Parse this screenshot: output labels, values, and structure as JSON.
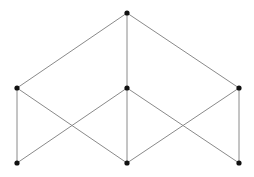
{
  "diagram": {
    "type": "hasse-diagram",
    "nodes": [
      {
        "id": "top",
        "x": 127,
        "y": 13
      },
      {
        "id": "mid-left",
        "x": 17,
        "y": 88
      },
      {
        "id": "mid-center",
        "x": 127,
        "y": 88
      },
      {
        "id": "mid-right",
        "x": 239,
        "y": 88
      },
      {
        "id": "bottom-left",
        "x": 17,
        "y": 163
      },
      {
        "id": "bottom-center",
        "x": 127,
        "y": 163
      },
      {
        "id": "bottom-right",
        "x": 239,
        "y": 163
      }
    ],
    "edges": [
      [
        "top",
        "mid-left"
      ],
      [
        "top",
        "mid-center"
      ],
      [
        "top",
        "mid-right"
      ],
      [
        "mid-left",
        "bottom-left"
      ],
      [
        "mid-left",
        "bottom-center"
      ],
      [
        "mid-center",
        "bottom-left"
      ],
      [
        "mid-center",
        "bottom-center"
      ],
      [
        "mid-center",
        "bottom-right"
      ],
      [
        "mid-right",
        "bottom-center"
      ],
      [
        "mid-right",
        "bottom-right"
      ]
    ],
    "colors": {
      "edge": "#8a8a8a",
      "node": "#111111",
      "background": "#ffffff"
    }
  }
}
